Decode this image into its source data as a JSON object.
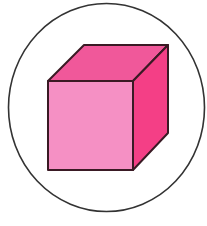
{
  "figure": {
    "frame_shape": "circle",
    "colors": {
      "background": "#ffffff",
      "circle_stroke": "#333333",
      "edge": "#3a1a24",
      "front_face": "#f590c4",
      "top_face": "#f0589a",
      "right_face": "#f43f86"
    }
  }
}
